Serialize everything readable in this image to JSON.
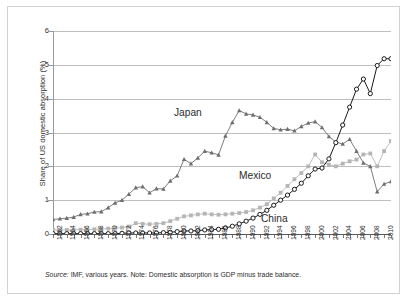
{
  "chart_data": {
    "type": "line",
    "title": "",
    "xlabel": "",
    "ylabel": "Share of US domestic absorption (%)",
    "ylim": [
      0,
      6
    ],
    "yticks": [
      0,
      1,
      2,
      3,
      4,
      5,
      6
    ],
    "xlim": [
      1962,
      2011
    ],
    "xticks": [
      1962,
      1964,
      1966,
      1968,
      1970,
      1972,
      1974,
      1976,
      1978,
      1980,
      1982,
      1984,
      1986,
      1988,
      1990,
      1992,
      1994,
      1996,
      1998,
      2000,
      2002,
      2004,
      2006,
      2008,
      2010
    ],
    "grid": true,
    "legend_position": "inline-annotations",
    "x": [
      1962,
      1963,
      1964,
      1965,
      1966,
      1967,
      1968,
      1969,
      1970,
      1971,
      1972,
      1973,
      1974,
      1975,
      1976,
      1977,
      1978,
      1979,
      1980,
      1981,
      1982,
      1983,
      1984,
      1985,
      1986,
      1987,
      1988,
      1989,
      1990,
      1991,
      1992,
      1993,
      1994,
      1995,
      1996,
      1997,
      1998,
      1999,
      2000,
      2001,
      2002,
      2003,
      2004,
      2005,
      2006,
      2007,
      2008,
      2009,
      2010,
      2011
    ],
    "series": [
      {
        "name": "Japan",
        "color": "#6e6e6e",
        "marker": "triangle",
        "values": [
          0.43,
          0.45,
          0.47,
          0.5,
          0.58,
          0.6,
          0.65,
          0.66,
          0.78,
          0.92,
          1.0,
          1.18,
          1.37,
          1.4,
          1.22,
          1.34,
          1.33,
          1.57,
          1.72,
          2.21,
          2.08,
          2.25,
          2.45,
          2.4,
          2.34,
          2.9,
          3.3,
          3.65,
          3.55,
          3.52,
          3.45,
          3.3,
          3.12,
          3.08,
          3.1,
          3.05,
          3.18,
          3.28,
          3.32,
          3.15,
          2.88,
          2.72,
          2.66,
          2.8,
          2.45,
          2.1,
          2.0,
          1.25,
          1.48,
          1.55
        ]
      },
      {
        "name": "Mexico",
        "color": "#b5b5b5",
        "marker": "square",
        "values": [
          0.12,
          0.12,
          0.12,
          0.13,
          0.13,
          0.13,
          0.14,
          0.15,
          0.16,
          0.17,
          0.19,
          0.22,
          0.32,
          0.3,
          0.29,
          0.3,
          0.32,
          0.38,
          0.45,
          0.52,
          0.55,
          0.58,
          0.6,
          0.58,
          0.57,
          0.58,
          0.6,
          0.62,
          0.65,
          0.7,
          0.78,
          0.88,
          1.05,
          1.22,
          1.42,
          1.62,
          1.8,
          2.0,
          2.35,
          2.12,
          2.05,
          2.0,
          2.08,
          2.15,
          2.2,
          2.35,
          2.38,
          2.0,
          2.45,
          2.75
        ]
      },
      {
        "name": "China",
        "color": "#1a1a1a",
        "marker": "open-circle",
        "values": [
          0.01,
          0.01,
          0.01,
          0.01,
          0.01,
          0.01,
          0.01,
          0.01,
          0.01,
          0.01,
          0.02,
          0.03,
          0.03,
          0.03,
          0.03,
          0.03,
          0.04,
          0.05,
          0.07,
          0.09,
          0.09,
          0.1,
          0.12,
          0.13,
          0.14,
          0.18,
          0.23,
          0.3,
          0.38,
          0.47,
          0.58,
          0.7,
          0.85,
          1.0,
          1.15,
          1.32,
          1.5,
          1.72,
          1.92,
          1.95,
          2.22,
          2.7,
          3.22,
          3.75,
          4.28,
          4.58,
          4.15,
          4.98,
          5.18,
          5.18
        ]
      }
    ]
  },
  "annotations": {
    "japan": "Japan",
    "mexico": "Mexico",
    "china": "China"
  },
  "note": {
    "source_label": "Source:",
    "text": " IMF, various years. Note: Domestic absorption is GDP minus trade balance."
  }
}
